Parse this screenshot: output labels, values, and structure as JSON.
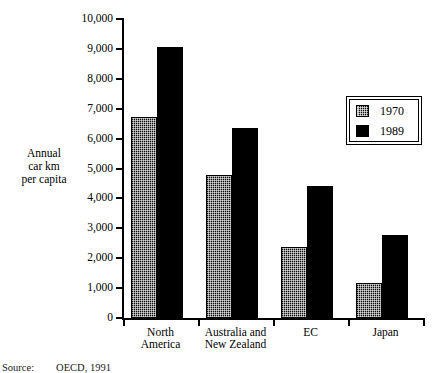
{
  "chart_data": {
    "type": "bar",
    "title": "",
    "subtitle": "",
    "xlabel": "",
    "ylabel": "Annual\ncar km\nper capita",
    "ylim": [
      0,
      10000
    ],
    "ytick_values": [
      0,
      1000,
      2000,
      3000,
      4000,
      5000,
      6000,
      7000,
      8000,
      9000,
      10000
    ],
    "ytick_labels": [
      "0",
      "1,000",
      "2,000",
      "3,000",
      "4,000",
      "5,000",
      "6,000",
      "7,000",
      "8,000",
      "9,000",
      "10,000"
    ],
    "categories": [
      "North\nAmerica",
      "Australia and\nNew Zealand",
      "EC",
      "Japan"
    ],
    "series": [
      {
        "name": "1970",
        "values": [
          6720,
          4780,
          2370,
          1170
        ],
        "fill": "hatched",
        "color": "#0d0d0d"
      },
      {
        "name": "1989",
        "values": [
          9060,
          6350,
          4400,
          2770
        ],
        "fill": "solid",
        "color": "#000000"
      }
    ],
    "legend": {
      "position": "top-right",
      "entries": [
        "1970",
        "1989"
      ]
    },
    "grid": false,
    "annotations": []
  },
  "source": {
    "label": "Source:",
    "text": "OECD, 1991"
  }
}
